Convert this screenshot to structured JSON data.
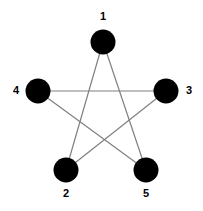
{
  "diagram": {
    "type": "star-polygon",
    "background_color": "#ffffff",
    "node_color": "#000000",
    "edge_color": "#808080",
    "label_color": "#000000",
    "node_radius": 12.5,
    "edge_width": 1.2,
    "nodes": [
      {
        "id": "1",
        "label": "1",
        "cx": 103,
        "cy": 42,
        "label_x": 103,
        "label_y": 17
      },
      {
        "id": "2",
        "label": "2",
        "cx": 66,
        "cy": 170,
        "label_x": 66,
        "label_y": 194
      },
      {
        "id": "3",
        "label": "3",
        "cx": 166,
        "cy": 91,
        "label_x": 189,
        "label_y": 91
      },
      {
        "id": "4",
        "label": "4",
        "cx": 38,
        "cy": 91,
        "label_x": 16,
        "label_y": 91
      },
      {
        "id": "5",
        "label": "5",
        "cx": 146,
        "cy": 170,
        "label_x": 146,
        "label_y": 194
      }
    ],
    "edges": [
      {
        "id": "edge-1-2",
        "from": "1",
        "to": "2",
        "x1": 103,
        "y1": 42,
        "x2": 66,
        "y2": 170
      },
      {
        "id": "edge-2-3",
        "from": "2",
        "to": "3",
        "x1": 66,
        "y1": 170,
        "x2": 166,
        "y2": 91
      },
      {
        "id": "edge-3-4",
        "from": "3",
        "to": "4",
        "x1": 166,
        "y1": 91,
        "x2": 38,
        "y2": 91
      },
      {
        "id": "edge-4-5",
        "from": "4",
        "to": "5",
        "x1": 38,
        "y1": 91,
        "x2": 146,
        "y2": 170
      },
      {
        "id": "edge-5-1",
        "from": "5",
        "to": "1",
        "x1": 146,
        "y1": 170,
        "x2": 103,
        "y2": 42
      }
    ]
  }
}
